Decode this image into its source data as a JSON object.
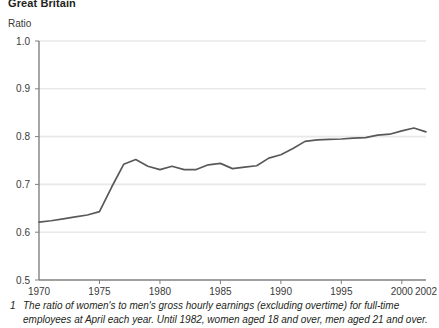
{
  "region_title": "Great Britain",
  "axis_unit_label": "Ratio",
  "footnote": {
    "marker": "1",
    "text": "The ratio of women's to men's gross hourly earnings (excluding overtime) for full-time employees at April each year. Until 1982, women aged 18 and over, men aged 21 and over."
  },
  "colors": {
    "line": "#58595b",
    "gridline": "#e8e8e8",
    "axis": "#808080",
    "text": "#3a3a3a"
  },
  "chart_data": {
    "type": "line",
    "title": "Great Britain",
    "xlabel": "",
    "ylabel": "Ratio",
    "ylim": [
      0.5,
      1.0
    ],
    "xlim": [
      1970,
      2002
    ],
    "grid": true,
    "legend": null,
    "ytick_labels": [
      "1.0",
      "0.9",
      "0.8",
      "0.7",
      "0.6",
      "0.5"
    ],
    "ytick_values": [
      1.0,
      0.9,
      0.8,
      0.7,
      0.6,
      0.5
    ],
    "xtick_labels": [
      "1970",
      "1975",
      "1980",
      "1985",
      "1990",
      "1995",
      "2000",
      "2002"
    ],
    "xtick_values": [
      1970,
      1975,
      1980,
      1985,
      1990,
      1995,
      2000,
      2002
    ],
    "x": [
      1970,
      1971,
      1972,
      1973,
      1974,
      1975,
      1976,
      1977,
      1978,
      1979,
      1980,
      1981,
      1982,
      1983,
      1984,
      1985,
      1986,
      1987,
      1988,
      1989,
      1990,
      1991,
      1992,
      1993,
      1994,
      1995,
      1996,
      1997,
      1998,
      1999,
      2000,
      2001,
      2002
    ],
    "series": [
      {
        "name": "Ratio of women's to men's gross hourly earnings",
        "values": [
          0.621,
          0.624,
          0.628,
          0.632,
          0.636,
          0.643,
          0.694,
          0.742,
          0.752,
          0.738,
          0.731,
          0.738,
          0.731,
          0.731,
          0.741,
          0.744,
          0.733,
          0.736,
          0.739,
          0.755,
          0.762,
          0.775,
          0.79,
          0.793,
          0.794,
          0.795,
          0.797,
          0.798,
          0.803,
          0.805,
          0.812,
          0.818,
          0.81
        ]
      }
    ]
  }
}
